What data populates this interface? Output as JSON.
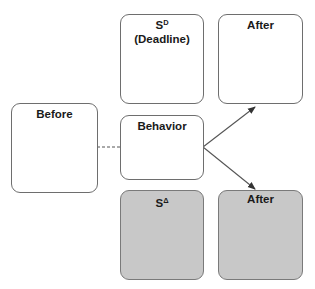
{
  "diagram": {
    "type": "contingency-diagram",
    "colors": {
      "border": "#6e6e6e",
      "shaded_fill": "#c8c8c8",
      "line": "#555555"
    },
    "boxes": {
      "before": {
        "label": "Before"
      },
      "sd": {
        "label_main": "S",
        "label_sup": "D",
        "label_sub": "(Deadline)"
      },
      "after_top": {
        "label": "After"
      },
      "behavior": {
        "label": "Behavior"
      },
      "sdelta": {
        "label_main": "S",
        "label_sup": "Δ"
      },
      "after_bottom": {
        "label": "After"
      }
    },
    "connections": [
      {
        "from": "before",
        "to": "behavior",
        "style": "dashed"
      },
      {
        "from": "behavior",
        "to": "after_top",
        "style": "arrow"
      },
      {
        "from": "behavior",
        "to": "after_bottom",
        "style": "arrow"
      }
    ]
  }
}
